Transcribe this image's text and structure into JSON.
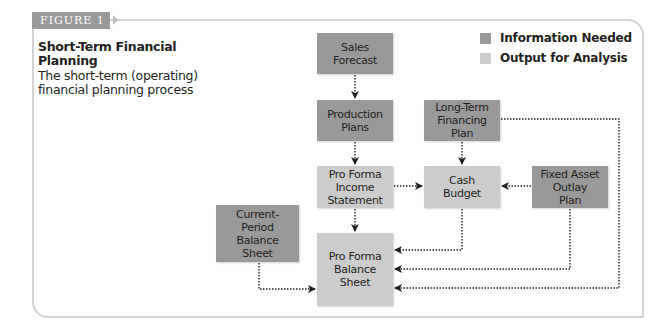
{
  "figure": {
    "tab_label": "FIGURE 1",
    "title": "Short-Term Financial Planning",
    "subtitle": "The short-term (operating) financial planning process"
  },
  "legend": {
    "items": [
      {
        "label": "Information Needed",
        "color": "#999999"
      },
      {
        "label": "Output for Analysis",
        "color": "#cccccc"
      }
    ]
  },
  "nodes": {
    "sales_forecast": {
      "label": "Sales\nForecast",
      "type": "Information Needed"
    },
    "production_plans": {
      "label": "Production\nPlans",
      "type": "Information Needed"
    },
    "long_term_financing_plan": {
      "label": "Long-Term\nFinancing\nPlan",
      "type": "Information Needed"
    },
    "pro_forma_income_statement": {
      "label": "Pro Forma\nIncome\nStatement",
      "type": "Output for Analysis"
    },
    "cash_budget": {
      "label": "Cash\nBudget",
      "type": "Output for Analysis"
    },
    "fixed_asset_outlay_plan": {
      "label": "Fixed Asset\nOutlay\nPlan",
      "type": "Information Needed"
    },
    "current_period_balance_sheet": {
      "label": "Current-\nPeriod\nBalance\nSheet",
      "type": "Information Needed"
    },
    "pro_forma_balance_sheet": {
      "label": "Pro Forma\nBalance Sheet",
      "type": "Output for Analysis"
    }
  },
  "edges": [
    {
      "from": "Sales Forecast",
      "to": "Production Plans"
    },
    {
      "from": "Production Plans",
      "to": "Pro Forma Income Statement"
    },
    {
      "from": "Long-Term Financing Plan",
      "to": "Cash Budget"
    },
    {
      "from": "Pro Forma Income Statement",
      "to": "Cash Budget"
    },
    {
      "from": "Fixed Asset Outlay Plan",
      "to": "Cash Budget"
    },
    {
      "from": "Pro Forma Income Statement",
      "to": "Pro Forma Balance Sheet"
    },
    {
      "from": "Cash Budget",
      "to": "Pro Forma Balance Sheet"
    },
    {
      "from": "Fixed Asset Outlay Plan",
      "to": "Pro Forma Balance Sheet"
    },
    {
      "from": "Long-Term Financing Plan",
      "to": "Pro Forma Balance Sheet"
    },
    {
      "from": "Current-Period Balance Sheet",
      "to": "Pro Forma Balance Sheet"
    }
  ],
  "colors": {
    "information_needed": "#999999",
    "output_for_analysis": "#cccccc",
    "connector": "#231f20",
    "frame": "#d2d2d2"
  }
}
